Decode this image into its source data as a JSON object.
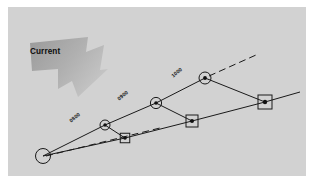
{
  "figure": {
    "name": "current-drift-track-diagram",
    "background_color": "#d2d2d2",
    "page_color": "#ffffff",
    "border_margin_px": 8
  },
  "annotations": {
    "current_label": "Current",
    "current_arrow": {
      "name": "current-arrow",
      "direction": "down-right",
      "fill_start": "#9d9d9d",
      "fill_end": "#bfbfbf"
    }
  },
  "time_labels": [
    {
      "text": "0800",
      "x": 68,
      "y": 118,
      "rotate": -40
    },
    {
      "text": "0900",
      "x": 116,
      "y": 96,
      "rotate": -40
    },
    {
      "text": "1000",
      "x": 170,
      "y": 73,
      "rotate": -40
    }
  ],
  "origin": {
    "name": "origin-station",
    "cx": 43,
    "cy": 156,
    "r": 7.5,
    "stroke": "#1a1a1a",
    "fill": "none"
  },
  "tracks": [
    {
      "name": "upper-track",
      "style": "solid",
      "stroke": "#1a1a1a",
      "points": [
        [
          43,
          156
        ],
        [
          105,
          125
        ],
        [
          156,
          103
        ],
        [
          205,
          78
        ]
      ]
    },
    {
      "name": "lower-track",
      "style": "solid",
      "stroke": "#1a1a1a",
      "points": [
        [
          43,
          156
        ],
        [
          125,
          138
        ],
        [
          192,
          121
        ],
        [
          265,
          102
        ],
        [
          300,
          92
        ]
      ]
    },
    {
      "name": "origin-dashed-ray",
      "style": "dashed",
      "stroke": "#1a1a1a",
      "points": [
        [
          43,
          156
        ],
        [
          160,
          128
        ]
      ]
    },
    {
      "name": "extension-dashed-ray",
      "style": "dashed",
      "stroke": "#1a1a1a",
      "points": [
        [
          209,
          76
        ],
        [
          256,
          55
        ]
      ]
    }
  ],
  "connectors": [
    {
      "name": "connector-0800",
      "from": [
        105,
        125
      ],
      "to": [
        125,
        138
      ]
    },
    {
      "name": "connector-0900",
      "from": [
        156,
        103
      ],
      "to": [
        192,
        121
      ]
    },
    {
      "name": "connector-1000",
      "from": [
        205,
        78
      ],
      "to": [
        265,
        102
      ]
    }
  ],
  "circle_markers": [
    {
      "name": "circle-marker-0800",
      "cx": 105,
      "cy": 125,
      "r": 5.0,
      "dot_r": 1.7
    },
    {
      "name": "circle-marker-0900",
      "cx": 156,
      "cy": 103,
      "r": 5.6,
      "dot_r": 1.8
    },
    {
      "name": "circle-marker-1000",
      "cx": 205,
      "cy": 78,
      "r": 6.0,
      "dot_r": 1.9
    }
  ],
  "square_markers": [
    {
      "name": "square-marker-0800",
      "cx": 125,
      "cy": 138,
      "size": 9.5,
      "dot_r": 1.8
    },
    {
      "name": "square-marker-0900",
      "cx": 192,
      "cy": 121,
      "size": 12.0,
      "dot_r": 2.0
    },
    {
      "name": "square-marker-1000",
      "cx": 265,
      "cy": 102,
      "size": 14.0,
      "dot_r": 2.2
    }
  ]
}
